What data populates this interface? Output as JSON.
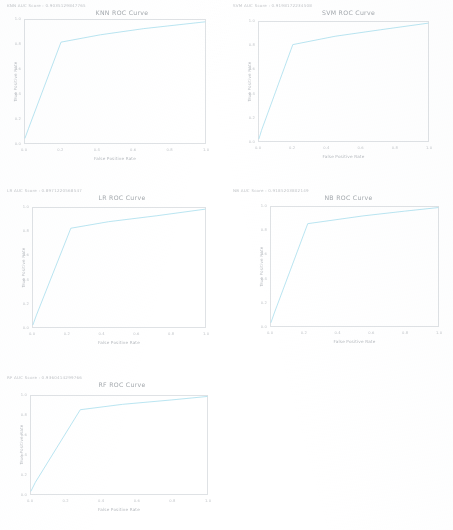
{
  "document": {
    "kind": "notebook-output",
    "background_color": "#ffffff",
    "line_color": "#aee0ef",
    "text_color": "#b4b8bd",
    "frame_color": "#dfe2e5"
  },
  "figures": [
    {
      "id": "knn",
      "score_line": "KNN AUC Score : 0.9035129847765",
      "chart_data": {
        "type": "line",
        "title": "KNN ROC Curve",
        "xlabel": "False Positive Rate",
        "ylabel": "True Positive Rate",
        "xlim": [
          0.0,
          1.0
        ],
        "ylim": [
          0.0,
          1.0
        ],
        "grid": false,
        "legend": "none",
        "xticks": [
          "0.0",
          "0.2",
          "0.4",
          "0.6",
          "0.8",
          "1.0"
        ],
        "yticks": [
          "0.0",
          "0.2",
          "0.4",
          "0.6",
          "0.8",
          "1.0"
        ],
        "series": [
          {
            "name": "ROC",
            "x": [
              0.0,
              0.02,
              0.2,
              0.42,
              0.66,
              1.0
            ],
            "y": [
              0.04,
              0.12,
              0.82,
              0.88,
              0.93,
              0.985
            ]
          }
        ]
      }
    },
    {
      "id": "svm",
      "score_line": "SVM AUC Score : 0.9198172234508",
      "chart_data": {
        "type": "line",
        "title": "SVM ROC Curve",
        "xlabel": "False Positive Rate",
        "ylabel": "True Positive Rate",
        "xlim": [
          0.0,
          1.0
        ],
        "ylim": [
          0.0,
          1.0
        ],
        "grid": false,
        "legend": "none",
        "xticks": [
          "0.0",
          "0.2",
          "0.4",
          "0.6",
          "0.8",
          "1.0"
        ],
        "yticks": [
          "0.0",
          "0.2",
          "0.4",
          "0.6",
          "0.8",
          "1.0"
        ],
        "series": [
          {
            "name": "ROC",
            "x": [
              0.0,
              0.015,
              0.2,
              0.45,
              0.72,
              1.0
            ],
            "y": [
              0.02,
              0.09,
              0.81,
              0.88,
              0.935,
              0.99
            ]
          }
        ]
      }
    },
    {
      "id": "lr",
      "score_line": "LR AUC Score : 0.8971220568547",
      "chart_data": {
        "type": "line",
        "title": "LR ROC Curve",
        "xlabel": "False Positive Rate",
        "ylabel": "True Positive Rate",
        "xlim": [
          0.0,
          1.0
        ],
        "ylim": [
          0.0,
          1.0
        ],
        "grid": false,
        "legend": "none",
        "xticks": [
          "0.0",
          "0.2",
          "0.4",
          "0.6",
          "0.8",
          "1.0"
        ],
        "yticks": [
          "0.0",
          "0.2",
          "0.4",
          "0.6",
          "0.8",
          "1.0"
        ],
        "series": [
          {
            "name": "ROC",
            "x": [
              0.0,
              0.02,
              0.22,
              0.44,
              0.72,
              1.0
            ],
            "y": [
              0.02,
              0.1,
              0.83,
              0.885,
              0.935,
              0.99
            ]
          }
        ]
      }
    },
    {
      "id": "nb",
      "score_line": "NB AUC Score : 0.9185203802149",
      "chart_data": {
        "type": "line",
        "title": "NB ROC Curve",
        "xlabel": "False Positive Rate",
        "ylabel": "True Positive Rate",
        "xlim": [
          0.0,
          1.0
        ],
        "ylim": [
          0.0,
          1.0
        ],
        "grid": false,
        "legend": "none",
        "xticks": [
          "0.0",
          "0.2",
          "0.4",
          "0.6",
          "0.8",
          "1.0"
        ],
        "yticks": [
          "0.0",
          "0.2",
          "0.4",
          "0.6",
          "0.8",
          "1.0"
        ],
        "series": [
          {
            "name": "ROC",
            "x": [
              0.0,
              0.02,
              0.22,
              0.55,
              0.8,
              1.0
            ],
            "y": [
              0.03,
              0.11,
              0.86,
              0.925,
              0.965,
              0.995
            ]
          }
        ]
      }
    },
    {
      "id": "rf",
      "score_line": "RF AUC Score : 0.9360414299766",
      "chart_data": {
        "type": "line",
        "title": "RF ROC Curve",
        "xlabel": "False Positive Rate",
        "ylabel": "True Positive Rate",
        "xlim": [
          0.0,
          1.0
        ],
        "ylim": [
          0.0,
          1.0
        ],
        "grid": false,
        "legend": "none",
        "xticks": [
          "0.0",
          "0.2",
          "0.4",
          "0.6",
          "0.8",
          "1.0"
        ],
        "yticks": [
          "0.0",
          "0.2",
          "0.4",
          "0.6",
          "0.8",
          "1.0"
        ],
        "series": [
          {
            "name": "ROC",
            "x": [
              0.0,
              0.025,
              0.28,
              0.52,
              0.8,
              1.0
            ],
            "y": [
              0.03,
              0.12,
              0.86,
              0.915,
              0.96,
              0.995
            ]
          }
        ]
      }
    }
  ]
}
